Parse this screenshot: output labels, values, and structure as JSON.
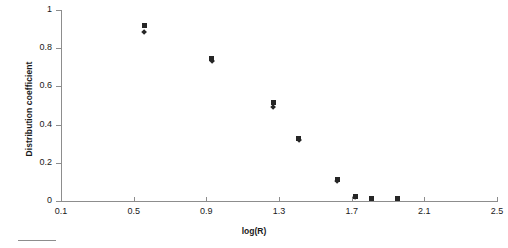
{
  "chart_data": {
    "type": "scatter",
    "title": "",
    "xlabel": "log(R)",
    "ylabel": "Distribution coefficient",
    "xlim": [
      0.1,
      2.5
    ],
    "ylim": [
      0,
      1
    ],
    "xticks": [
      "0.1",
      "0.5",
      "0.9",
      "1.3",
      "1.7",
      "2.1",
      "2.5"
    ],
    "xtick_values": [
      0.1,
      0.5,
      0.9,
      1.3,
      1.7,
      2.1,
      2.5
    ],
    "yticks": [
      "0",
      "0.2",
      "0.4",
      "0.6",
      "0.8",
      "1"
    ],
    "ytick_values": [
      0,
      0.2,
      0.4,
      0.6,
      0.8,
      1
    ],
    "grid": false,
    "legend": "none",
    "series": [
      {
        "name": "series-square",
        "marker": "square",
        "color": "#262626",
        "points": [
          {
            "x": 0.56,
            "y": 0.92
          },
          {
            "x": 0.93,
            "y": 0.745
          },
          {
            "x": 1.27,
            "y": 0.515
          },
          {
            "x": 1.41,
            "y": 0.325
          },
          {
            "x": 1.62,
            "y": 0.115
          },
          {
            "x": 1.72,
            "y": 0.025
          },
          {
            "x": 1.81,
            "y": 0.015
          },
          {
            "x": 1.95,
            "y": 0.012
          }
        ]
      },
      {
        "name": "series-diamond",
        "marker": "diamond",
        "color": "#262626",
        "points": [
          {
            "x": 0.56,
            "y": 0.885
          },
          {
            "x": 0.93,
            "y": 0.735
          },
          {
            "x": 1.27,
            "y": 0.49
          },
          {
            "x": 1.41,
            "y": 0.32
          },
          {
            "x": 1.62,
            "y": 0.105
          },
          {
            "x": 1.72,
            "y": 0.02
          }
        ]
      }
    ]
  }
}
